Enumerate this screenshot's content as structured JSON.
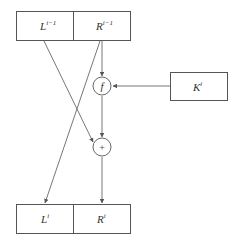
{
  "diagram": {
    "type": "feistel-round",
    "inputs": {
      "left": {
        "base": "L",
        "sup": "i−1"
      },
      "right": {
        "base": "R",
        "sup": "i−1"
      }
    },
    "key": {
      "base": "K",
      "sup": "i"
    },
    "function_node": {
      "symbol": "f"
    },
    "xor_node": {
      "symbol": "+"
    },
    "outputs": {
      "left": {
        "base": "L",
        "sup": "i"
      },
      "right": {
        "base": "R",
        "sup": "i"
      }
    },
    "edges": [
      {
        "from": "R^{i-1}",
        "to": "f"
      },
      {
        "from": "K^i",
        "to": "f"
      },
      {
        "from": "f",
        "to": "xor"
      },
      {
        "from": "L^{i-1}",
        "to": "xor"
      },
      {
        "from": "R^{i-1}",
        "to": "L^i"
      },
      {
        "from": "xor",
        "to": "R^i"
      }
    ]
  }
}
